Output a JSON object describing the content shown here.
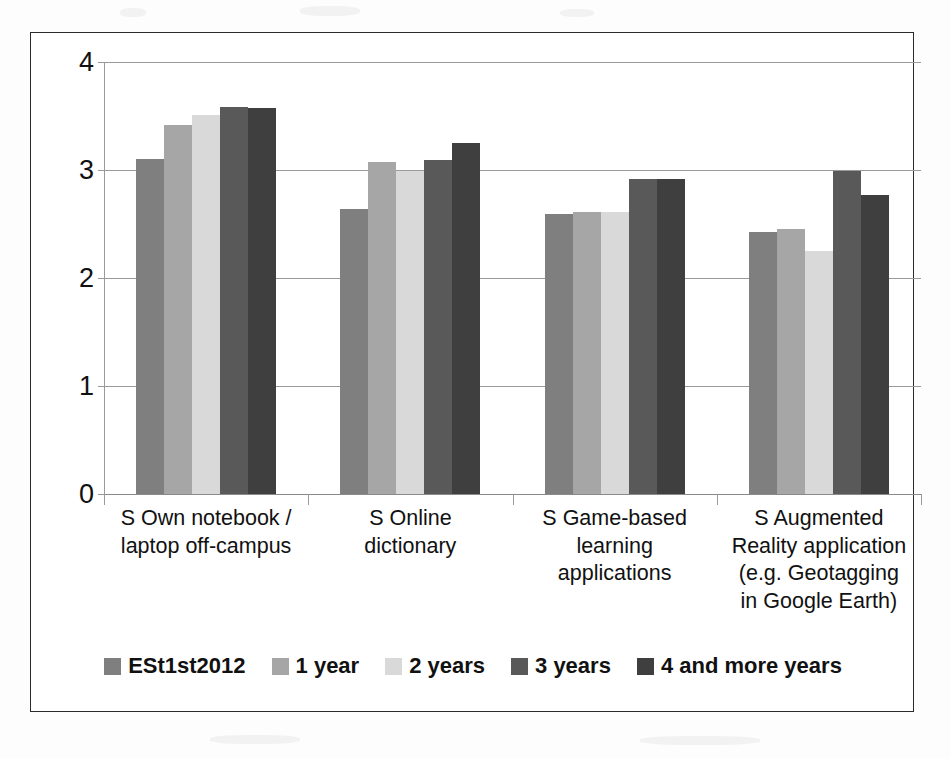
{
  "chart_data": {
    "type": "bar",
    "title": "",
    "subtitle": "",
    "xlabel": "",
    "ylabel": "",
    "ylim": [
      0,
      4
    ],
    "yticks": [
      "0",
      "1",
      "2",
      "3",
      "4"
    ],
    "grid": true,
    "legend_position": "bottom",
    "categories": [
      "S Own notebook / laptop off-campus",
      "S Online dictionary",
      "S Game-based learning applications",
      "S Augmented Reality application (e.g. Geotagging in Google Earth)"
    ],
    "category_lines": [
      [
        "S Own notebook /",
        "laptop off-campus"
      ],
      [
        "S Online",
        "dictionary"
      ],
      [
        "S Game-based",
        "learning",
        "applications"
      ],
      [
        "S Augmented",
        "Reality application",
        "(e.g. Geotagging",
        "in Google Earth)"
      ]
    ],
    "series": [
      {
        "name": "ESt1st2012",
        "color": "#7f7f7f",
        "values": [
          3.1,
          2.64,
          2.59,
          2.43
        ]
      },
      {
        "name": "1 year",
        "color": "#a6a6a6",
        "values": [
          3.42,
          3.07,
          2.61,
          2.45
        ]
      },
      {
        "name": "2 years",
        "color": "#d9d9d9",
        "values": [
          3.51,
          2.99,
          2.61,
          2.25
        ]
      },
      {
        "name": "3 years",
        "color": "#595959",
        "values": [
          3.58,
          3.09,
          2.92,
          2.99
        ]
      },
      {
        "name": "4 and more years",
        "color": "#3f3f3f",
        "values": [
          3.57,
          3.25,
          2.92,
          2.77
        ]
      }
    ]
  },
  "legend": {
    "items": [
      {
        "label": "ESt1st2012",
        "color": "#7f7f7f"
      },
      {
        "label": "1 year",
        "color": "#a6a6a6"
      },
      {
        "label": "2 years",
        "color": "#d9d9d9"
      },
      {
        "label": "3 years",
        "color": "#595959"
      },
      {
        "label": "4 and more years",
        "color": "#3f3f3f"
      }
    ]
  }
}
